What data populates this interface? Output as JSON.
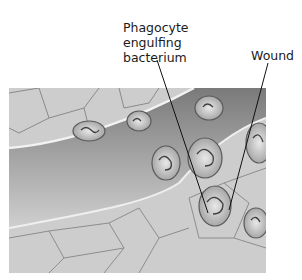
{
  "diagram": {
    "labels": [
      {
        "id": "phagocyte",
        "lines": [
          "Phagocyte",
          "engulfing",
          "bacterium"
        ]
      },
      {
        "id": "wound",
        "lines": [
          "Wound"
        ]
      }
    ],
    "illustration": {
      "subject": "tissue with blood vessel, phagocytes migrating toward wound",
      "palette": {
        "background": "#c9c9c9",
        "vessel": "#8f8f8f",
        "cell_outline": "#6e6e6e",
        "highlight": "#efefef"
      }
    },
    "leader_lines": [
      {
        "from": "phagocyte",
        "x1": 157,
        "y1": 60,
        "x2": 208,
        "y2": 213
      },
      {
        "from": "wound",
        "x1": 268,
        "y1": 63,
        "x2": 229,
        "y2": 210
      }
    ]
  }
}
